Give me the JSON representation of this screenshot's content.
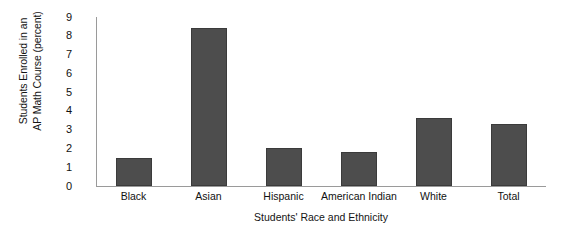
{
  "chart_data": {
    "type": "bar",
    "title": "",
    "xlabel": "Students' Race and Ethnicity",
    "ylabel": "Students Enrolled in an\nAP Math Course (percent)",
    "categories": [
      "Black",
      "Asian",
      "Hispanic",
      "American Indian",
      "White",
      "Total"
    ],
    "values": [
      1.5,
      8.4,
      2.0,
      1.8,
      3.6,
      3.3
    ],
    "ylim": [
      0,
      9
    ],
    "yticks": [
      "0",
      "1",
      "2",
      "3",
      "4",
      "5",
      "6",
      "7",
      "8",
      "9"
    ],
    "grid": false,
    "legend": "none",
    "bar_color": "#4d4d4d",
    "axis_color": "#9a9a9a",
    "background": "#ffffff"
  }
}
